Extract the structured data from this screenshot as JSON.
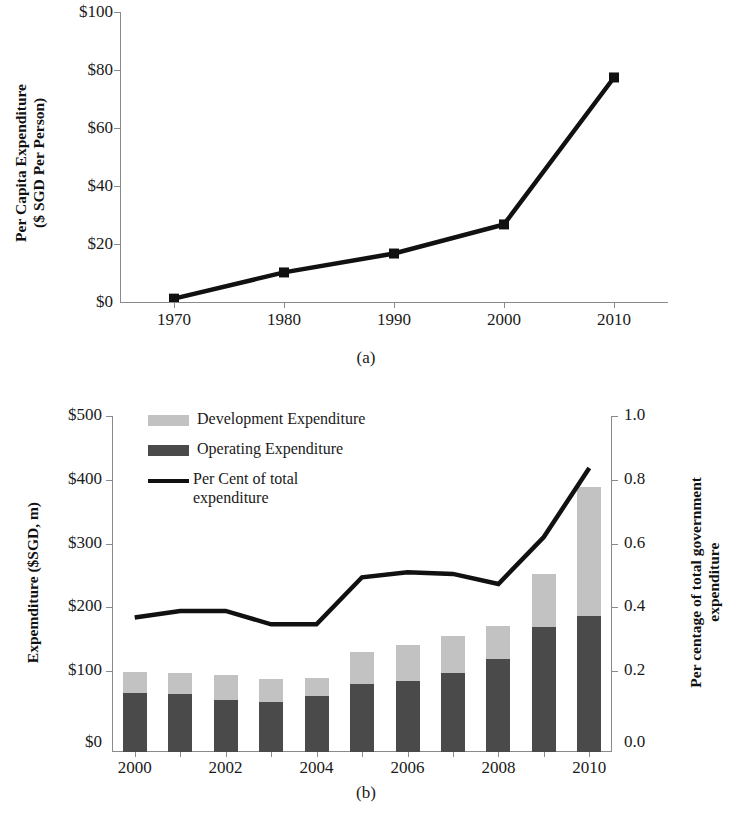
{
  "figure": {
    "panel_a_label": "(a)",
    "panel_b_label": "(b)"
  },
  "colors": {
    "development": "#c2c2c2",
    "operating": "#4a4a4a",
    "line": "#111111",
    "axis": "#8a8a8a"
  },
  "panel_a": {
    "ylabel_line1": "Per Capita Expenditure",
    "ylabel_line2": "($ SGD Per Person)",
    "y_ticks": [
      "$0",
      "$20",
      "$40",
      "$60",
      "$80",
      "$100"
    ],
    "x_ticks": [
      "1970",
      "1980",
      "1990",
      "2000",
      "2010"
    ],
    "marker": "square"
  },
  "panel_b": {
    "ylabel_left": "Expemditure ($SGD, m)",
    "ylabel_right_line1": "Per centage of total government",
    "ylabel_right_line2": "expenditure",
    "y_ticks_left": [
      "$0",
      "$100",
      "$200",
      "$300",
      "$400",
      "$500"
    ],
    "y_ticks_right": [
      "0.0",
      "0.2",
      "0.4",
      "0.6",
      "0.8",
      "1.0"
    ],
    "x_ticks": [
      "2000",
      "2002",
      "2004",
      "2006",
      "2008",
      "2010"
    ],
    "legend": [
      {
        "label": "Development Expenditure",
        "marker": "swatch-development"
      },
      {
        "label": "Operating Expenditure",
        "marker": "swatch-operating"
      },
      {
        "label": "Per Cent of total\nexpenditure",
        "label_line1": "Per Cent of total",
        "label_line2": "expenditure",
        "marker": "line-percent"
      }
    ]
  },
  "chart_data": [
    {
      "type": "line",
      "panel": "(a)",
      "title": "",
      "xlabel": "",
      "ylabel": "Per Capita Expenditure ($ SGD Per Person)",
      "x": [
        1970,
        1980,
        1990,
        2000,
        2010
      ],
      "xtick_labels": [
        "1970",
        "1980",
        "1990",
        "2000",
        "2010"
      ],
      "ytick_labels": [
        "$0",
        "$20",
        "$40",
        "$60",
        "$80",
        "$100"
      ],
      "values": [
        1.5,
        10.5,
        17.0,
        27.0,
        77.5
      ],
      "ylim": [
        0,
        100
      ],
      "xlim": [
        1965,
        2015
      ],
      "grid": false,
      "legend": "none",
      "marker": "square",
      "series": [
        {
          "name": "Per Capita Expenditure",
          "values": [
            1.5,
            10.5,
            17.0,
            27.0,
            77.5
          ]
        }
      ]
    },
    {
      "type": "bar",
      "panel": "(b)",
      "title": "",
      "xlabel": "",
      "ylabel": "Expemditure ($SGD, m)",
      "y2label": "Per centage of total government expenditure",
      "stacked": true,
      "categories": [
        "2000",
        "2001",
        "2002",
        "2003",
        "2004",
        "2005",
        "2006",
        "2007",
        "2008",
        "2009",
        "2010"
      ],
      "x": [
        2000,
        2001,
        2002,
        2003,
        2004,
        2005,
        2006,
        2007,
        2008,
        2009,
        2010
      ],
      "ylim": [
        0,
        500
      ],
      "y2lim": [
        0.0,
        1.0
      ],
      "ytick_labels": [
        "$0",
        "$100",
        "$200",
        "$300",
        "$400",
        "$500"
      ],
      "y2tick_labels": [
        "0.0",
        "0.2",
        "0.4",
        "0.6",
        "0.8",
        "1.0"
      ],
      "xtick_labels": [
        "2000",
        "2002",
        "2004",
        "2006",
        "2008",
        "2010"
      ],
      "grid": false,
      "legend": "upper-left",
      "series": [
        {
          "name": "Operating Expenditure",
          "stack": "bottom",
          "values": [
            88,
            86,
            77,
            75,
            83,
            101,
            106,
            118,
            139,
            186,
            202
          ]
        },
        {
          "name": "Development Expenditure",
          "stack": "top",
          "values": [
            31,
            31,
            38,
            33,
            27,
            48,
            54,
            54,
            49,
            79,
            192
          ]
        },
        {
          "name": "Total Expenditure",
          "derived": true,
          "values": [
            119,
            117,
            115,
            108,
            110,
            149,
            160,
            172,
            188,
            265,
            394
          ]
        },
        {
          "name": "Per Cent of total expenditure",
          "axis": "y2",
          "values": [
            0.4,
            0.42,
            0.42,
            0.38,
            0.38,
            0.52,
            0.535,
            0.53,
            0.5,
            0.64,
            0.845
          ]
        }
      ]
    }
  ]
}
